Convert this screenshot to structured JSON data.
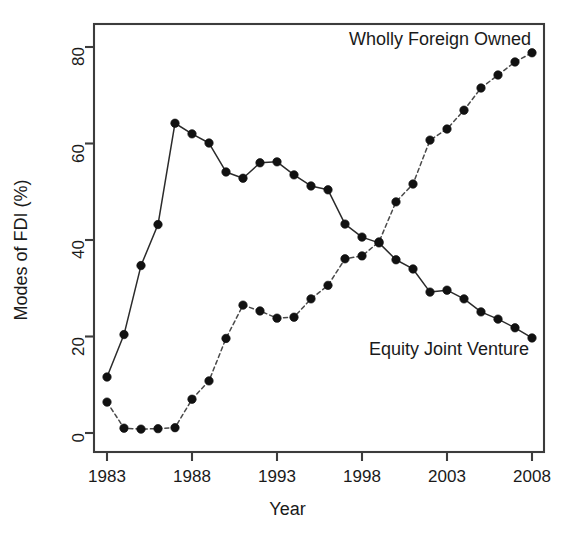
{
  "chart_data": {
    "type": "line",
    "title": "",
    "xlabel": "Year",
    "ylabel": "Modes of FDI (%)",
    "xlim": [
      1983,
      2008
    ],
    "ylim": [
      0,
      83
    ],
    "grid": false,
    "legend_position": "in-plot annotations",
    "x_ticks": [
      1983,
      1988,
      1993,
      1998,
      2003,
      2008
    ],
    "y_ticks": [
      0,
      20,
      40,
      60,
      80
    ],
    "x": [
      1983,
      1984,
      1985,
      1986,
      1987,
      1988,
      1989,
      1990,
      1991,
      1992,
      1993,
      1994,
      1995,
      1996,
      1997,
      1998,
      1999,
      2000,
      2001,
      2002,
      2003,
      2004,
      2005,
      2006,
      2007,
      2008
    ],
    "series": [
      {
        "name": "Equity Joint Venture",
        "line_style": "solid",
        "marker": "filled-circle",
        "annotation": "Equity Joint Venture",
        "values": [
          11.6,
          20.4,
          34.7,
          43.2,
          64.2,
          62.0,
          60.1,
          54.1,
          52.8,
          56.0,
          56.2,
          53.5,
          51.2,
          50.4,
          43.3,
          40.6,
          39.4,
          35.9,
          34.0,
          29.2,
          29.6,
          27.8,
          25.1,
          23.6,
          21.8,
          19.7
        ]
      },
      {
        "name": "Wholly Foreign Owned",
        "line_style": "dashed",
        "marker": "filled-circle",
        "annotation": "Wholly Foreign Owned",
        "values": [
          6.4,
          1.0,
          0.8,
          0.9,
          1.1,
          7.0,
          10.8,
          19.6,
          26.5,
          25.3,
          23.8,
          24.0,
          27.8,
          30.6,
          36.1,
          36.7,
          39.6,
          47.9,
          51.6,
          60.7,
          63.0,
          66.9,
          71.5,
          74.2,
          76.9,
          78.8
        ]
      }
    ]
  },
  "annotations": {
    "top_right": "Wholly Foreign Owned",
    "bottom_right": "Equity Joint Venture"
  },
  "axes": {
    "x_title": "Year",
    "y_title": "Modes of FDI (%)",
    "x_tick_labels": [
      "1983",
      "1988",
      "1993",
      "1998",
      "2003",
      "2008"
    ],
    "y_tick_labels": [
      "0",
      "20",
      "40",
      "60",
      "80"
    ]
  },
  "colors": {
    "axis": "#3c3c3c",
    "solid_series": "#2b2b2b",
    "dashed_series": "#4a4a4a",
    "marker": "#111111",
    "background": "#ffffff",
    "text": "#1a1a1a"
  }
}
